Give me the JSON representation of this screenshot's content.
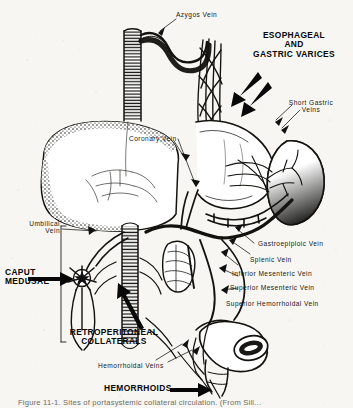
{
  "figure": {
    "background_color": "#f7f6f3",
    "ink_color": "#101010",
    "caption": "Figure 11-1.  Sites of portasystemic collateral circulation. (From Sill...",
    "width": 353,
    "height": 408
  },
  "labels": {
    "azygos_vein": "Azygos Vein",
    "esophageal_and_gastric_varices": {
      "line1": "ESOPHAGEAL",
      "line2": "AND",
      "line3": "GASTRIC VARICES"
    },
    "short_gastric_veins": {
      "line1": "Short Gastric",
      "line2": "Veins"
    },
    "coronary_vein": "Coronary Vein",
    "umbilical_vein": {
      "line1": "Umbilical",
      "line2": "Vein"
    },
    "caput_medusae": {
      "line1": "CAPUT",
      "line2": "MEDUSAE"
    },
    "retroperitoneal_collaterals": {
      "line1": "RETROPERITONEAL",
      "line2": "COLLATERALS"
    },
    "gastroepiploic_vein": "Gastroepiploic Vein",
    "splenic_vein": "Splenic Vein",
    "inferior_mesenteric_vein": "Inferior Mesenteric Vein",
    "superior_mesenteric_vein": "Superior Mesenteric Vein",
    "superior_hemorrhoidal_vein": "Superior Hemorrhoidal Vein",
    "hemorrhoidal_veins": "Hemorrhoidal Veins",
    "hemorrhoids": "HEMORRHOIDS"
  },
  "anatomy": {
    "esophagus": "esophagus",
    "azygos_vein_vessel": "azygos-vein",
    "varices_mesh": "esophageal-gastric-varices-mesh",
    "liver": "liver",
    "stomach": "stomach",
    "spleen": "spleen",
    "inferior_vena_cava": "inferior-vena-cava",
    "portal_vein": "portal-vein",
    "pancreas": "pancreas",
    "umbilicus_caput": "caput-medusae-vein-star",
    "rectum": "rectum",
    "colon_loop": "colon"
  }
}
